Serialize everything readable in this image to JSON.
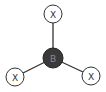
{
  "diagram": {
    "type": "trigonal-planar-molecule",
    "center_atom": {
      "label": "B",
      "fill": "#3a3a3a",
      "text_color": "#8a8a8a"
    },
    "ligands": [
      {
        "label": "X",
        "position": "top"
      },
      {
        "label": "X",
        "position": "bottom-left"
      },
      {
        "label": "X",
        "position": "bottom-right"
      }
    ],
    "colors": {
      "bond": "#333333",
      "ligand_stroke": "#333333",
      "ligand_fill": "#ffffff",
      "ligand_text": "#333333"
    }
  }
}
